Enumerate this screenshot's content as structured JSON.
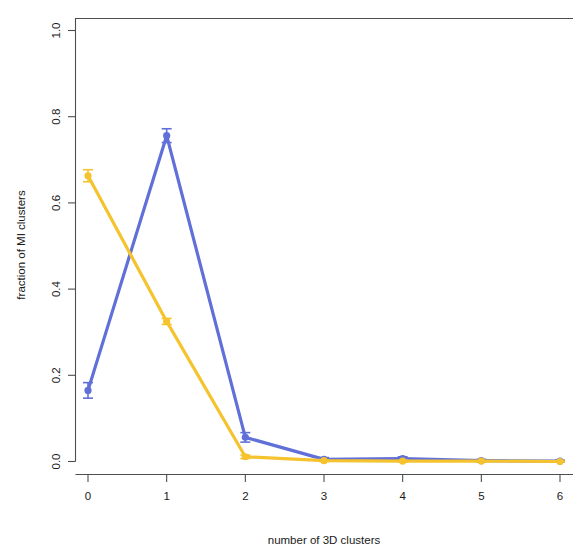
{
  "chart_data": {
    "type": "line",
    "title": "",
    "xlabel": "number of 3D clusters",
    "ylabel": "fraction of MI clusters",
    "x": [
      0,
      1,
      2,
      3,
      4,
      5,
      6
    ],
    "xlim": [
      0,
      6
    ],
    "ylim": [
      0.0,
      1.05
    ],
    "grid": false,
    "legend": "none",
    "xticklabels": [
      "0",
      "1",
      "2",
      "3",
      "4",
      "5",
      "6"
    ],
    "yticklabels": [
      "0.0",
      "0.2",
      "0.4",
      "0.6",
      "0.8",
      "1.0"
    ],
    "yticks": [
      0.0,
      0.2,
      0.4,
      0.6,
      0.8,
      1.0
    ],
    "series": [
      {
        "name": "blue-series",
        "color": "#6070d8",
        "values": [
          0.165,
          0.756,
          0.056,
          0.005,
          0.007,
          0.002,
          0.001
        ],
        "errors": [
          0.018,
          0.016,
          0.011,
          0.004,
          0.004,
          0.003,
          0.002
        ],
        "marker": "circle"
      },
      {
        "name": "yellow-series",
        "color": "#f5c32e",
        "values": [
          0.663,
          0.325,
          0.011,
          0.002,
          0.001,
          0.001,
          0.0
        ],
        "errors": [
          0.014,
          0.007,
          0.004,
          0.002,
          0.002,
          0.001,
          0.001
        ],
        "marker": "circle"
      }
    ]
  },
  "axes": {
    "x_label": "number of 3D clusters",
    "y_label": "fraction of MI clusters"
  },
  "colors": {
    "blue": "#6070d8",
    "yellow": "#f5c32e",
    "frame": "#4d4d4d",
    "text": "#1a1a1a",
    "background": "#ffffff"
  }
}
